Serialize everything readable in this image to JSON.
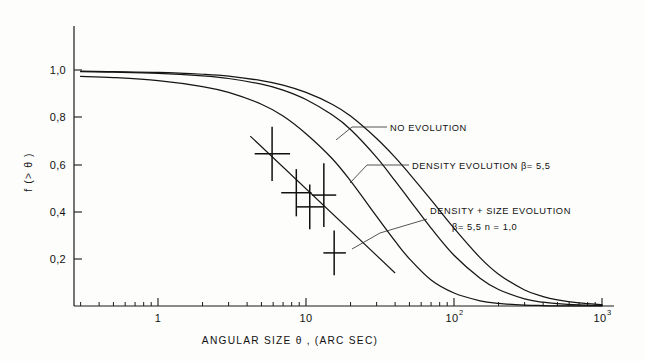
{
  "chart_data": {
    "type": "line",
    "title": "",
    "xlabel": "ANGULAR SIZE  θ , (ARC SEC)",
    "ylabel": "f (> θ )",
    "xscale": "log",
    "xlim": [
      0.3,
      1000
    ],
    "ylim": [
      0,
      1.05
    ],
    "grid": false,
    "legend_position": "inline-annotations",
    "x_tick_labels": [
      {
        "value": 1,
        "label": "1"
      },
      {
        "value": 10,
        "label": "10"
      },
      {
        "value": 100,
        "label": "10",
        "exponent": "2"
      },
      {
        "value": 1000,
        "label": "10",
        "exponent": "3"
      }
    ],
    "y_tick_labels": [
      {
        "value": 1.0,
        "label": "1,0"
      },
      {
        "value": 0.8,
        "label": "0,8"
      },
      {
        "value": 0.6,
        "label": "0,6"
      },
      {
        "value": 0.4,
        "label": "0,4"
      },
      {
        "value": 0.2,
        "label": "0,2"
      }
    ],
    "series": [
      {
        "name": "NO EVOLUTION",
        "annotation": "NO EVOLUTION",
        "points": [
          [
            0.3,
            0.995
          ],
          [
            0.5,
            0.993
          ],
          [
            1.0,
            0.99
          ],
          [
            2.0,
            0.982
          ],
          [
            3.0,
            0.974
          ],
          [
            5.0,
            0.955
          ],
          [
            7.0,
            0.936
          ],
          [
            10.0,
            0.905
          ],
          [
            15.0,
            0.855
          ],
          [
            20.0,
            0.805
          ],
          [
            30.0,
            0.71
          ],
          [
            40.0,
            0.63
          ],
          [
            50.0,
            0.56
          ],
          [
            70.0,
            0.45
          ],
          [
            100.0,
            0.33
          ],
          [
            150.0,
            0.205
          ],
          [
            200.0,
            0.135
          ],
          [
            300.0,
            0.068
          ],
          [
            400.0,
            0.04
          ],
          [
            500.0,
            0.026
          ],
          [
            700.0,
            0.013
          ],
          [
            1000.0,
            0.006
          ]
        ]
      },
      {
        "name": "DENSITY EVOLUTION",
        "annotation": "DENSITY EVOLUTION β= 5,5",
        "beta": "5,5",
        "points": [
          [
            0.3,
            0.993
          ],
          [
            0.5,
            0.991
          ],
          [
            1.0,
            0.986
          ],
          [
            2.0,
            0.975
          ],
          [
            3.0,
            0.964
          ],
          [
            5.0,
            0.94
          ],
          [
            7.0,
            0.915
          ],
          [
            10.0,
            0.875
          ],
          [
            15.0,
            0.81
          ],
          [
            20.0,
            0.748
          ],
          [
            30.0,
            0.63
          ],
          [
            40.0,
            0.53
          ],
          [
            50.0,
            0.45
          ],
          [
            70.0,
            0.33
          ],
          [
            100.0,
            0.215
          ],
          [
            150.0,
            0.118
          ],
          [
            200.0,
            0.07
          ],
          [
            300.0,
            0.03
          ],
          [
            400.0,
            0.016
          ],
          [
            500.0,
            0.01
          ],
          [
            700.0,
            0.005
          ],
          [
            1000.0,
            0.002
          ]
        ]
      },
      {
        "name": "DENSITY + SIZE EVOLUTION",
        "annotation": "DENSITY + SIZE EVOLUTION",
        "annotation_line2": "β= 5,5      n = 1,0",
        "beta": "5,5",
        "n": "1,0",
        "points": [
          [
            0.3,
            0.973
          ],
          [
            0.5,
            0.968
          ],
          [
            1.0,
            0.955
          ],
          [
            2.0,
            0.93
          ],
          [
            3.0,
            0.905
          ],
          [
            5.0,
            0.855
          ],
          [
            7.0,
            0.805
          ],
          [
            10.0,
            0.73
          ],
          [
            15.0,
            0.625
          ],
          [
            20.0,
            0.53
          ],
          [
            30.0,
            0.38
          ],
          [
            40.0,
            0.275
          ],
          [
            50.0,
            0.2
          ],
          [
            70.0,
            0.11
          ],
          [
            100.0,
            0.055
          ],
          [
            150.0,
            0.022
          ],
          [
            200.0,
            0.011
          ],
          [
            300.0,
            0.004
          ],
          [
            400.0,
            0.002
          ],
          [
            500.0,
            0.001
          ],
          [
            700.0,
            0.0005
          ],
          [
            1000.0,
            0.0002
          ]
        ]
      },
      {
        "name": "data fit line",
        "points": [
          [
            4.2,
            0.72
          ],
          [
            40.0,
            0.14
          ]
        ]
      }
    ],
    "data_points": [
      {
        "x": 5.9,
        "y": 0.645,
        "yerr_low": 0.115,
        "yerr_high": 0.115,
        "xerr_low": 1.4,
        "xerr_high": 1.9
      },
      {
        "x": 8.6,
        "y": 0.48,
        "yerr_low": 0.1,
        "yerr_high": 0.1,
        "xerr_low": 1.8,
        "xerr_high": 2.3
      },
      {
        "x": 10.6,
        "y": 0.42,
        "yerr_low": 0.095,
        "yerr_high": 0.095,
        "xerr_low": 1.9,
        "xerr_high": 2.5
      },
      {
        "x": 13.2,
        "y": 0.47,
        "yerr_low": 0.135,
        "yerr_high": 0.135,
        "xerr_low": 2.2,
        "xerr_high": 2.8
      },
      {
        "x": 15.5,
        "y": 0.225,
        "yerr_low": 0.095,
        "yerr_high": 0.095,
        "xerr_low": 2.4,
        "xerr_high": 3.1
      }
    ]
  },
  "figure": {
    "xlabel": "ANGULAR SIZE  θ , (ARC SEC)",
    "ylabel": "f (> θ )",
    "annotations": {
      "no_evolution": "NO EVOLUTION",
      "density_evolution": "DENSITY EVOLUTION β= 5,5",
      "density_size_evolution": "DENSITY + SIZE EVOLUTION",
      "density_size_params": "β= 5,5      n = 1,0"
    },
    "y_ticks": [
      "1,0",
      "0,8",
      "0,6",
      "0,4",
      "0,2"
    ],
    "x_ticks": [
      "1",
      "10",
      "10",
      "10"
    ],
    "x_tick_exponents": [
      "",
      "",
      "2",
      "3"
    ]
  }
}
